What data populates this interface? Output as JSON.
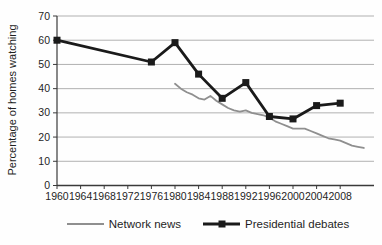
{
  "chart_data": {
    "type": "line",
    "title": "",
    "xlabel": "",
    "ylabel": "Percentage of homes watching",
    "ylim": [
      0,
      70
    ],
    "ytick_step": 10,
    "yticks": [
      0,
      10,
      20,
      30,
      40,
      50,
      60,
      70
    ],
    "xticks": [
      1960,
      1964,
      1968,
      1972,
      1976,
      1980,
      1984,
      1988,
      1992,
      1996,
      2000,
      2004,
      2008
    ],
    "xlim": [
      1960,
      2013.7
    ],
    "grid": "horizontal",
    "legend_position": "bottom",
    "series": [
      {
        "name": "Network news",
        "color": "#8f8f8f",
        "marker": "none",
        "line_width": 1.8,
        "x": [
          1980,
          1981,
          1982,
          1983,
          1984,
          1985,
          1986,
          1987,
          1988,
          1989,
          1990,
          1991,
          1992,
          1993,
          1994,
          1995,
          1996,
          1997,
          1998,
          1999,
          2000,
          2001,
          2002,
          2003,
          2004,
          2005,
          2006,
          2007,
          2008,
          2009,
          2010,
          2011,
          2012
        ],
        "values": [
          42,
          40,
          38.5,
          37.5,
          36,
          35.5,
          37,
          35,
          33.5,
          32,
          31,
          30.5,
          31,
          30,
          29.5,
          29,
          28,
          26.5,
          25.5,
          24.5,
          23.5,
          23.5,
          23.5,
          22.5,
          21.5,
          20.5,
          19.5,
          19,
          18.5,
          17.5,
          16.5,
          16,
          15.5
        ]
      },
      {
        "name": "Presidential debates",
        "color": "#1a1a1a",
        "marker": "square",
        "marker_size": 7,
        "line_width": 2.8,
        "x": [
          1960,
          1976,
          1980,
          1984,
          1988,
          1992,
          1996,
          2000,
          2004,
          2008
        ],
        "values": [
          60,
          51,
          59,
          46,
          36,
          42.5,
          28.5,
          27.5,
          33,
          34
        ]
      }
    ]
  },
  "colors": {
    "background": "#fefefe",
    "grid": "#a8a8a8",
    "axis": "#3a3a3a",
    "text": "#1f1f1f",
    "network_news": "#8f8f8f",
    "debates": "#1a1a1a"
  }
}
